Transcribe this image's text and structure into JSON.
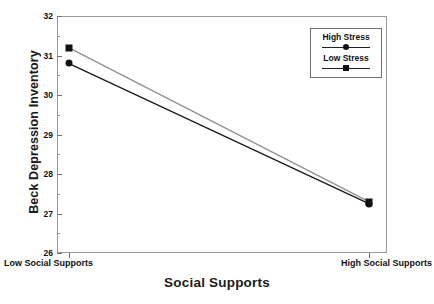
{
  "chart_data": {
    "type": "line",
    "title": "",
    "xlabel": "Social Supports",
    "ylabel": "Beck Depression Inventory",
    "categories": [
      "Low Social Supports",
      "High Social Supports"
    ],
    "x": [
      0,
      1
    ],
    "ylim": [
      26,
      32
    ],
    "y_ticks": [
      26,
      27,
      28,
      29,
      30,
      31,
      32
    ],
    "y_tick_labels": [
      "26",
      "27",
      "28",
      "29",
      "30",
      "31",
      "32"
    ],
    "grid": false,
    "legend_position": "top-right",
    "series": [
      {
        "name": "High Stress",
        "marker": "circle",
        "color": "#1a1a1a",
        "values": [
          30.8,
          27.25
        ]
      },
      {
        "name": "Low Stress",
        "marker": "square",
        "color": "#8f8f8f",
        "values": [
          31.2,
          27.3
        ]
      }
    ]
  },
  "axes": {
    "y_title": "Beck Depression Inventory",
    "x_title": "Social Supports",
    "y_tick_labels": [
      "32",
      "31",
      "30",
      "29",
      "28",
      "27",
      "26"
    ],
    "x_tick_labels": [
      "Low Social Supports",
      "High Social Supports"
    ]
  },
  "legend": {
    "entries": [
      {
        "label": "High Stress",
        "marker": "circle"
      },
      {
        "label": "Low Stress",
        "marker": "square"
      }
    ]
  }
}
